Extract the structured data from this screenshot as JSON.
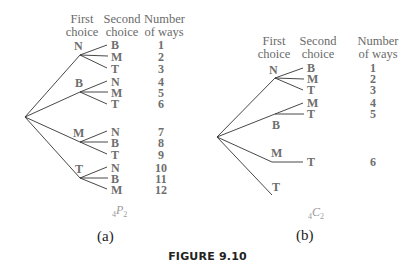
{
  "caption": "FIGURE 9.10",
  "headers": {
    "first": [
      "First",
      "choice"
    ],
    "second": [
      "Second",
      "choice"
    ],
    "ways": [
      "Number",
      "of ways"
    ]
  },
  "tree_a": {
    "label": "(a)",
    "notation": {
      "pre": "4",
      "letter": "P",
      "sub": "2"
    },
    "first_choices": [
      "N",
      "B",
      "M",
      "T"
    ],
    "second_choices": [
      "B",
      "M",
      "T",
      "N",
      "M",
      "T",
      "N",
      "B",
      "T",
      "N",
      "B",
      "M"
    ],
    "ways": [
      "1",
      "2",
      "3",
      "4",
      "5",
      "6",
      "7",
      "8",
      "9",
      "10",
      "11",
      "12"
    ]
  },
  "tree_b": {
    "label": "(b)",
    "notation": {
      "pre": "4",
      "letter": "C",
      "sub": "2"
    },
    "first_choices": [
      "N",
      "B",
      "M",
      "T"
    ],
    "second_choices": [
      "B",
      "M",
      "T",
      "M",
      "T",
      "T"
    ],
    "ways": [
      "1",
      "2",
      "3",
      "4",
      "5",
      "6"
    ]
  },
  "colors": {
    "line": "#333333",
    "text": "#6e6e6e",
    "caption": "#222222"
  }
}
